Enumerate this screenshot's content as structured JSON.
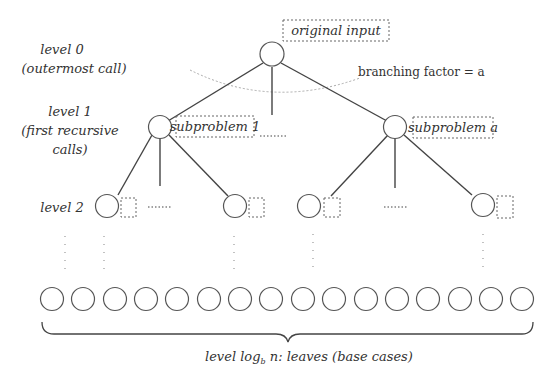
{
  "diagram": {
    "type": "recursion-tree",
    "labels": {
      "level0_line1": "level 0",
      "level0_line2": "(outermost call)",
      "level1_line1": "level 1",
      "level1_line2": "(first recursive",
      "level1_line3": "calls)",
      "level2": "level 2",
      "root_box": "original input",
      "branching": "branching factor = a",
      "sub1_box": "subproblem 1",
      "suba_box": "subproblem a",
      "leaves_prefix": "level log",
      "leaves_sub": "b",
      "leaves_suffix": " n: leaves (base cases)"
    },
    "levels": [
      {
        "level": 0,
        "nodes": 1,
        "annotation": "original input"
      },
      {
        "level": 1,
        "nodes_shown": [
          "subproblem 1",
          "subproblem a"
        ]
      },
      {
        "level": 2,
        "nodes_shown": 6
      },
      {
        "level": "log_b n",
        "nodes_shown": 17,
        "description": "leaves (base cases)"
      }
    ],
    "colors": {
      "stroke": "#444444",
      "text": "#333333",
      "dashed": "#666666",
      "arc": "#aaaaaa"
    }
  }
}
